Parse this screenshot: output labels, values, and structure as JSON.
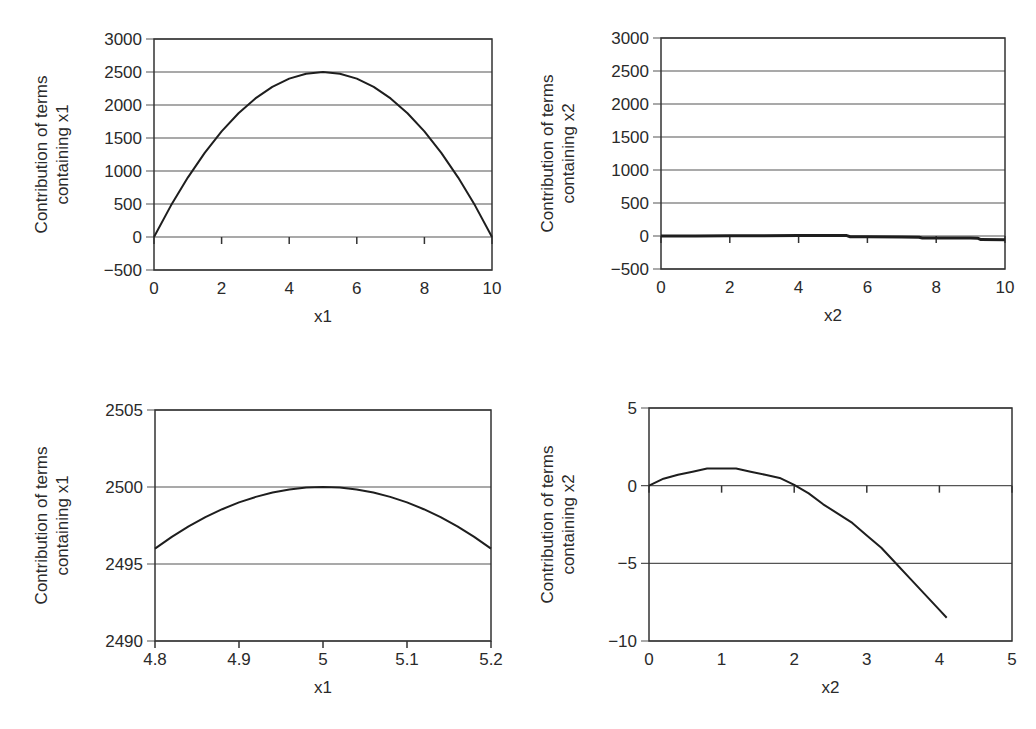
{
  "chart_data": [
    {
      "id": "top-left",
      "type": "line",
      "title": "",
      "xlabel": "x1",
      "ylabel": "Contribution of terms containing x1",
      "ylabel_lines": [
        "Contribution of terms",
        "containing x1"
      ],
      "xlim": [
        0,
        10
      ],
      "ylim": [
        -500,
        3000
      ],
      "xticks": [
        0,
        2,
        4,
        6,
        8,
        10
      ],
      "yticks": [
        3000,
        2500,
        2000,
        1500,
        1000,
        500,
        0,
        -500
      ],
      "ytick_labels": [
        "3000",
        "2500",
        "2000",
        "1500",
        "1000",
        "500",
        "0",
        "−500"
      ],
      "grid": "horizontal",
      "x": [
        0,
        0.5,
        1,
        1.5,
        2,
        2.5,
        3,
        3.5,
        4,
        4.5,
        5,
        5.5,
        6,
        6.5,
        7,
        7.5,
        8,
        8.5,
        9,
        9.5,
        10
      ],
      "y": [
        0,
        475,
        900,
        1275,
        1600,
        1875,
        2100,
        2275,
        2400,
        2475,
        2500,
        2475,
        2400,
        2275,
        2100,
        1875,
        1600,
        1275,
        900,
        475,
        0
      ],
      "plot_box": {
        "left": 154,
        "right": 492,
        "top": 39,
        "bottom": 270
      }
    },
    {
      "id": "top-right",
      "type": "line",
      "title": "",
      "xlabel": "x2",
      "ylabel": "Contribution of terms containing x2",
      "ylabel_lines": [
        "Contribution of terms",
        "containing x2"
      ],
      "xlim": [
        0,
        10
      ],
      "ylim": [
        -500,
        3000
      ],
      "xticks": [
        0,
        2,
        4,
        6,
        8,
        10
      ],
      "yticks": [
        3000,
        2500,
        2000,
        1500,
        1000,
        500,
        0,
        -500
      ],
      "ytick_labels": [
        "3000",
        "2500",
        "2000",
        "1500",
        "1000",
        "500",
        "0",
        "−500"
      ],
      "grid": "horizontal",
      "x": [
        0,
        1,
        2,
        3,
        4,
        5,
        5.4,
        5.5,
        6,
        7,
        7.5,
        7.6,
        8,
        9,
        9.2,
        9.3,
        10
      ],
      "y": [
        0,
        2,
        4,
        5,
        6,
        6,
        6,
        -10,
        -12,
        -16,
        -18,
        -30,
        -30,
        -32,
        -34,
        -55,
        -58
      ],
      "plot_box": {
        "left": 661,
        "right": 1005,
        "top": 38,
        "bottom": 269
      }
    },
    {
      "id": "bottom-left",
      "type": "line",
      "title": "",
      "xlabel": "x1",
      "ylabel": "Contribution of terms containing x1",
      "ylabel_lines": [
        "Contribution of terms",
        "containing x1"
      ],
      "xlim": [
        4.8,
        5.2
      ],
      "ylim": [
        2490,
        2505
      ],
      "xticks": [
        4.8,
        4.9,
        5,
        5.1,
        5.2
      ],
      "xtick_labels": [
        "4.8",
        "4.9",
        "5",
        "5.1",
        "5.2"
      ],
      "yticks": [
        2505,
        2500,
        2495,
        2490
      ],
      "ytick_labels": [
        "2505",
        "2500",
        "2495",
        "2490"
      ],
      "grid": "horizontal",
      "x": [
        4.8,
        4.82,
        4.84,
        4.86,
        4.88,
        4.9,
        4.92,
        4.94,
        4.96,
        4.98,
        5.0,
        5.02,
        5.04,
        5.06,
        5.08,
        5.1,
        5.12,
        5.14,
        5.16,
        5.18,
        5.2
      ],
      "y": [
        2496.0,
        2496.76,
        2497.44,
        2498.04,
        2498.56,
        2499.0,
        2499.36,
        2499.64,
        2499.84,
        2499.96,
        2500.0,
        2499.96,
        2499.84,
        2499.64,
        2499.36,
        2499.0,
        2498.56,
        2498.04,
        2497.44,
        2496.76,
        2496.0
      ],
      "plot_box": {
        "left": 155,
        "right": 491,
        "top": 410,
        "bottom": 641
      }
    },
    {
      "id": "bottom-right",
      "type": "line",
      "title": "",
      "xlabel": "x2",
      "ylabel": "Contribution of terms containing x2",
      "ylabel_lines": [
        "Contribution of terms",
        "containing x2"
      ],
      "xlim": [
        0,
        5
      ],
      "ylim": [
        -10,
        5
      ],
      "xticks": [
        0,
        1,
        2,
        3,
        4,
        5
      ],
      "yticks": [
        5,
        0,
        -5,
        -10
      ],
      "ytick_labels": [
        "5",
        "0",
        "−5",
        "−10"
      ],
      "grid": "horizontal",
      "x": [
        0,
        0.2,
        0.4,
        0.6,
        0.8,
        1.0,
        1.2,
        1.4,
        1.6,
        1.8,
        2.0,
        2.2,
        2.4,
        2.6,
        2.8,
        3.0,
        3.2,
        3.4,
        3.6,
        3.8,
        4.0,
        4.1
      ],
      "y": [
        0,
        0.45,
        0.7,
        0.9,
        1.1,
        1.1,
        1.1,
        0.9,
        0.7,
        0.5,
        0.05,
        -0.5,
        -1.2,
        -1.8,
        -2.4,
        -3.2,
        -4.0,
        -5.0,
        -6.0,
        -7.0,
        -8.0,
        -8.5
      ],
      "plot_box": {
        "left": 649,
        "right": 1012,
        "top": 408,
        "bottom": 641
      }
    }
  ],
  "colors": {
    "line": "#1e1e1e",
    "grid": "#555555",
    "axis": "#333333",
    "background": "#ffffff"
  }
}
